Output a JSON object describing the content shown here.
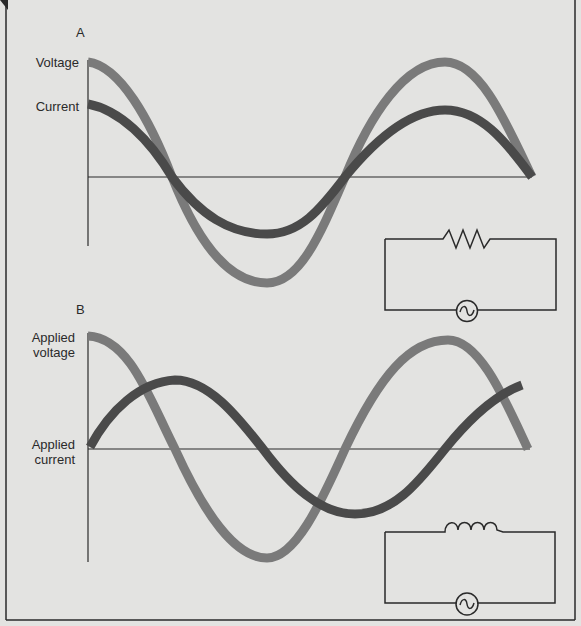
{
  "panel_a": {
    "title": "A",
    "voltage_label": "Voltage",
    "current_label": "Current",
    "circuit": "resistor-with-ac-source"
  },
  "panel_b": {
    "title": "B",
    "voltage_label_line1": "Applied",
    "voltage_label_line2": "voltage",
    "current_label_line1": "Applied",
    "current_label_line2": "current",
    "circuit": "inductor-with-ac-source"
  },
  "colors": {
    "background": "#e3e3e1",
    "voltage_wave": "#7a7a7a",
    "current_wave": "#4a4a4a",
    "lines": "#2a2a2a"
  }
}
